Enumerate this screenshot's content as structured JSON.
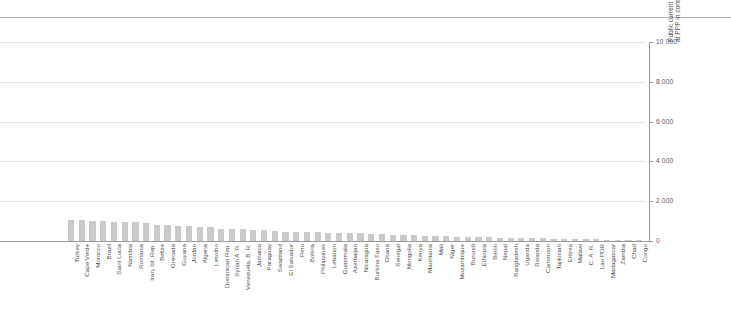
{
  "figure": {
    "name": "primary-education-expenditure-per-pupil-bar-chart"
  },
  "axis": {
    "y_title": "Public current expenditure on primary education per pupil (unit cost) at PPP in constant 2005 US$",
    "y_ticks": [
      "0",
      "2 000",
      "4 000",
      "6 000",
      "8 000",
      "10 000"
    ]
  },
  "chart_data": {
    "type": "bar",
    "title": "",
    "xlabel": "",
    "ylabel": "Public current expenditure on primary education per pupil (unit cost) at PPP in constant 2005 US$",
    "ylim": [
      0,
      10000
    ],
    "yticks": [
      0,
      2000,
      4000,
      6000,
      8000,
      10000
    ],
    "ytick_labels": [
      "0",
      "2 000",
      "4 000",
      "6 000",
      "8 000",
      "10 000"
    ],
    "grid": true,
    "legend": null,
    "orientation": "vertical",
    "bar_color": "#c9c9c9",
    "categories": [
      "Turkey",
      "Cape Verde",
      "Morocco",
      "Brazil",
      "Saint Lucia",
      "Namibia",
      "Romania",
      "Iran, Isl. Rep.",
      "Belize",
      "Grenada",
      "Guyana",
      "Jordan",
      "Algeria",
      "Lesotho",
      "Dominican Rep.",
      "Syrian A. R.",
      "Venezuela, B. R.",
      "Jamaica",
      "Paraguay",
      "Swaziland",
      "El Salvador",
      "Peru",
      "Bolivia",
      "Philippines",
      "Lebanon",
      "Guatemala",
      "Azerbaijan",
      "Nicaragua",
      "Burkina Faso",
      "Ghana",
      "Senegal",
      "Mongolia",
      "Kenya",
      "Mauritania",
      "Mali",
      "Niger",
      "Mozambique",
      "Burundi",
      "Ethiopia",
      "Benin",
      "Nepal",
      "Bangladesh",
      "Uganda",
      "Rwanda",
      "Cameroon",
      "Tajikistan",
      "Eritrea",
      "Malawi",
      "C. A. R.",
      "Lao PDR",
      "Madagascar",
      "Zambia",
      "Chad",
      "Congo"
    ],
    "values": [
      1080,
      1060,
      1030,
      1010,
      980,
      960,
      940,
      930,
      820,
      790,
      760,
      740,
      720,
      700,
      620,
      600,
      590,
      570,
      540,
      520,
      470,
      460,
      450,
      430,
      420,
      410,
      400,
      380,
      350,
      330,
      320,
      300,
      290,
      270,
      250,
      230,
      215,
      200,
      190,
      180,
      170,
      160,
      150,
      140,
      130,
      120,
      110,
      100,
      90,
      80,
      70,
      60,
      50,
      40
    ]
  }
}
